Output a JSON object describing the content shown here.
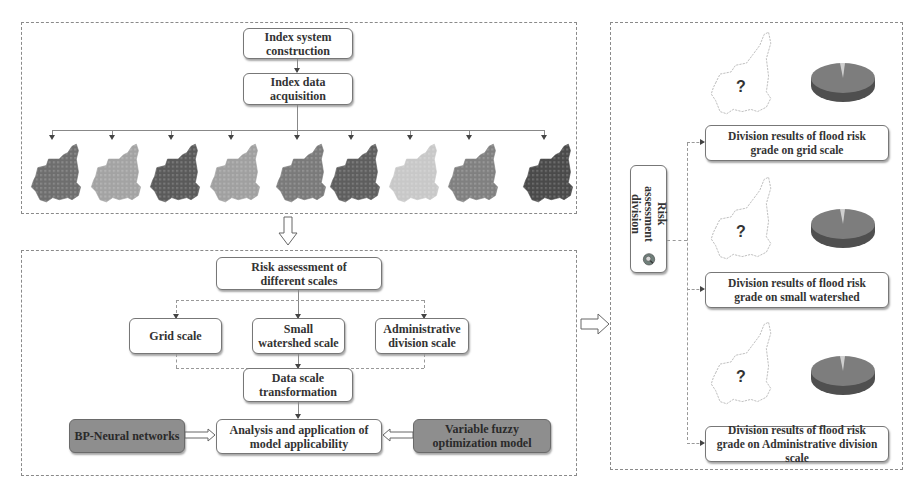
{
  "top_panel": {
    "boxes": {
      "index_system": "Index system construction",
      "index_data": "Index data acquisition"
    },
    "index_maps": [
      {
        "name": "index-map-1",
        "shade": "#6e6e6e"
      },
      {
        "name": "index-map-2",
        "shade": "#a3a3a3"
      },
      {
        "name": "index-map-3",
        "shade": "#5a5a5a"
      },
      {
        "name": "index-map-4",
        "shade": "#a0a0a0"
      },
      {
        "name": "index-map-5",
        "shade": "#7a7a7a"
      },
      {
        "name": "index-map-6",
        "shade": "#5e5e5e"
      },
      {
        "name": "index-map-7",
        "shade": "#c8c8c8"
      },
      {
        "name": "index-map-8",
        "shade": "#808080"
      },
      {
        "name": "index-map-9",
        "shade": "#4a4a4a"
      }
    ]
  },
  "middle_panel": {
    "boxes": {
      "risk_assessment": "Risk assessment of different scales",
      "grid_scale": "Grid scale",
      "small_watershed": "Small watershed scale",
      "administrative": "Administrative division scale",
      "data_scale": "Data scale transformation",
      "analysis": "Analysis and application of model applicability",
      "bp_neural": "BP-Neural networks",
      "variable_fuzzy": "Variable fuzzy optimization model"
    }
  },
  "right_panel": {
    "side_label": "Risk assessment division",
    "results": [
      {
        "label": "Division results of flood risk grade on grid scale",
        "map_mark": "?"
      },
      {
        "label": "Division results of flood risk grade on small watershed",
        "map_mark": "?"
      },
      {
        "label": "Division results of flood risk grade on Administrative division scale",
        "map_mark": "?"
      }
    ]
  },
  "colors": {
    "dark_box": "#8e8e8e",
    "border": "#777777",
    "panel_border": "#8a8a8a"
  }
}
